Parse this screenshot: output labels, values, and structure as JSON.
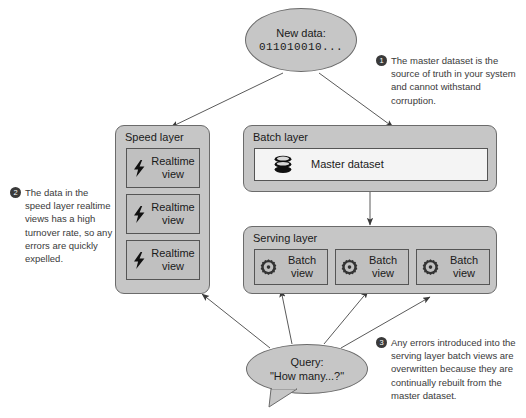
{
  "diagram": {
    "colors": {
      "panel_fill": "#c6c6c6",
      "box_fill": "#c0c0c0",
      "box_fill_light": "#f4f4f4",
      "stroke": "#6b6b6b",
      "text": "#1a1a1a",
      "callout_text": "#3a3a3a",
      "badge_fill": "#3a3a3a"
    }
  },
  "new_data": {
    "label": "New data:",
    "value": "011010010..."
  },
  "speed_layer": {
    "title": "Speed layer",
    "views": [
      {
        "icon": "lightning-icon",
        "label_line1": "Realtime",
        "label_line2": "view"
      },
      {
        "icon": "lightning-icon",
        "label_line1": "Realtime",
        "label_line2": "view"
      },
      {
        "icon": "lightning-icon",
        "label_line1": "Realtime",
        "label_line2": "view"
      }
    ]
  },
  "batch_layer": {
    "title": "Batch layer",
    "master_dataset": {
      "icon": "database-icon",
      "label": "Master dataset"
    }
  },
  "serving_layer": {
    "title": "Serving layer",
    "views": [
      {
        "icon": "gear-icon",
        "label_line1": "Batch",
        "label_line2": "view"
      },
      {
        "icon": "gear-icon",
        "label_line1": "Batch",
        "label_line2": "view"
      },
      {
        "icon": "gear-icon",
        "label_line1": "Batch",
        "label_line2": "view"
      }
    ]
  },
  "query": {
    "label": "Query:",
    "value": "\"How many...?\""
  },
  "callouts": [
    {
      "number": "1",
      "text": "The master dataset is the source of truth in your system and cannot withstand corruption."
    },
    {
      "number": "2",
      "text": "The data in the speed layer realtime views has a high turnover rate, so any errors are quickly expelled."
    },
    {
      "number": "3",
      "text": "Any errors introduced into the serving layer batch views are overwritten because they are continually rebuilt from the master dataset."
    }
  ]
}
